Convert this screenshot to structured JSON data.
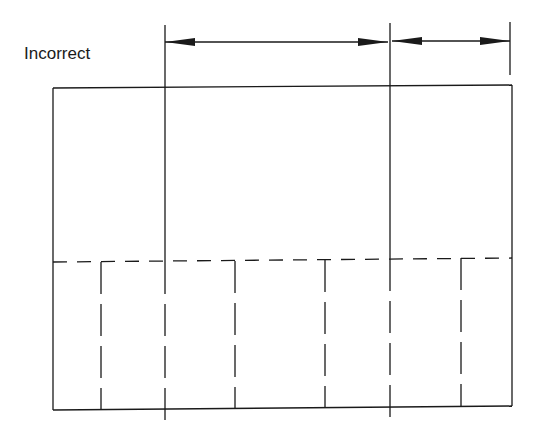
{
  "diagram": {
    "label": "Incorrect",
    "colors": {
      "stroke": "#1a1a1a",
      "background": "#ffffff"
    },
    "outer_rect": {
      "x1": 53,
      "y1_left": 88,
      "y1_right": 85,
      "x2": 512,
      "y2_left": 410,
      "y2_right": 406
    },
    "dashed_horizontal": {
      "x1": 53,
      "y1": 262,
      "x2": 512,
      "y2": 258
    },
    "extension_lines": [
      {
        "x": 165,
        "y1": 25,
        "y2_solid": 262,
        "y2": 420
      },
      {
        "x": 390,
        "y1": 23,
        "y2_solid": 259,
        "y2": 420
      },
      {
        "x": 510,
        "y1": 22,
        "y2": 75
      }
    ],
    "dimension_arrows": [
      {
        "x1": 165,
        "x2": 388,
        "y": 42
      },
      {
        "x1": 392,
        "x2": 510,
        "y": 41
      }
    ],
    "dashed_verticals": [
      {
        "x": 101,
        "y1": 262,
        "y2": 409
      },
      {
        "x": 235,
        "y1": 261,
        "y2": 408
      },
      {
        "x": 325,
        "y1": 260,
        "y2": 407
      },
      {
        "x": 461,
        "y1": 258,
        "y2": 406
      }
    ]
  }
}
